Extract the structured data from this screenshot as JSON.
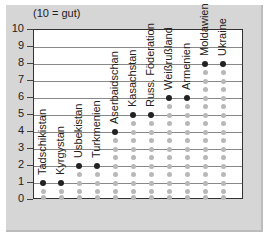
{
  "chart_data": {
    "type": "scatter",
    "title": "",
    "subtitle": "(10 = gut)",
    "xlabel": "",
    "ylabel": "",
    "ylim": [
      0,
      10
    ],
    "yticks": [
      0,
      1,
      2,
      3,
      4,
      5,
      6,
      7,
      8,
      9,
      10
    ],
    "grid": true,
    "categories": [
      "Tadschikistan",
      "Kyrgystan",
      "Usbekistan",
      "Turkmenien",
      "Aserbaidschan",
      "Kasachstan",
      "Russ. Föderation",
      "Weißrußland",
      "Armenien",
      "Moldawien",
      "Ukraine"
    ],
    "values": [
      1,
      1,
      2,
      2,
      4,
      5,
      5,
      6,
      6,
      8,
      8
    ],
    "colors": {
      "active": "#222222",
      "inactive": "#b8b8b8",
      "frame": "#d6d6d6"
    }
  }
}
